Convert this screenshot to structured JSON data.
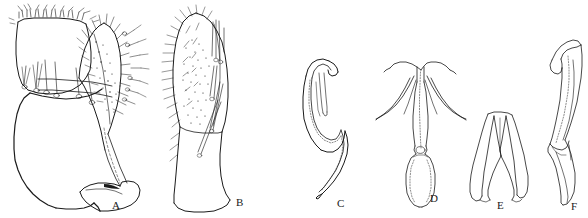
{
  "figure": {
    "type": "scientific-line-drawing-plate",
    "medium": "black ink line drawing on white background",
    "background_color": "#ffffff",
    "ink_color": "#1b1b1b",
    "panel_count": 6,
    "width_px": 588,
    "height_px": 218
  },
  "panels": [
    {
      "id": "A",
      "label": "A",
      "label_x": 112,
      "label_y": 200,
      "description": "Large gonocoxite with basal lobe and slender gonostylus bearing dense setae",
      "bbox": [
        8,
        4,
        148,
        214
      ]
    },
    {
      "id": "B",
      "label": "B",
      "label_x": 236,
      "label_y": 197,
      "description": "Elongate segment densely covered with setae and spine-like bristles",
      "bbox": [
        160,
        6,
        250,
        212
      ]
    },
    {
      "id": "C",
      "label": "C",
      "label_x": 337,
      "label_y": 198,
      "description": "Sinuous hook-shaped sclerite with recurved apex",
      "bbox": [
        296,
        58,
        360,
        212
      ]
    },
    {
      "id": "D",
      "label": "D",
      "label_x": 430,
      "label_y": 193,
      "description": "Y-shaped aedeagal apodeme with paired lateral arms and ovoid basal capsule",
      "bbox": [
        376,
        58,
        470,
        206
      ]
    },
    {
      "id": "E",
      "label": "E",
      "label_x": 497,
      "label_y": 200,
      "description": "Bifurcate forked sclerite with two diverging arms",
      "bbox": [
        466,
        108,
        532,
        208
      ]
    },
    {
      "id": "F",
      "label": "F",
      "label_x": 571,
      "label_y": 201,
      "description": "Narrow elongate blade-like sclerite with angled apex",
      "bbox": [
        538,
        36,
        586,
        212
      ]
    }
  ],
  "caption": {
    "present": false,
    "text": ""
  }
}
